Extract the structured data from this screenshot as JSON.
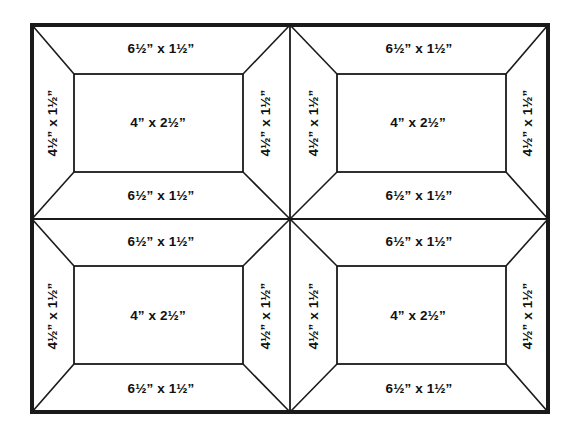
{
  "diagram": {
    "type": "quilt-block-cutting-diagram",
    "background_color": "#ffffff",
    "line_color": "#1a1a1a",
    "text_color": "#111111",
    "outer_border_width_px": 4,
    "inner_line_width_px": 1.6,
    "grid": {
      "rows": 2,
      "cols": 2,
      "blocks": 4
    },
    "labels": {
      "top_strip": "6½” x 1½”",
      "bottom_strip": "6½” x 1½”",
      "left_strip": "4½” x 1½”",
      "right_strip": "4½” x 1½”",
      "center_piece": "4” x 2½”"
    },
    "blocks": [
      {
        "id": "block-top-left",
        "position": "top-left",
        "center": "4” x 2½”",
        "top": "6½” x 1½”",
        "bottom": "6½” x 1½”",
        "left": "4½” x 1½”",
        "right": "4½” x 1½”"
      },
      {
        "id": "block-top-right",
        "position": "top-right",
        "center": "4” x 2½”",
        "top": "6½” x 1½”",
        "bottom": "6½” x 1½”",
        "left": "4½” x 1½”",
        "right": "4½” x 1½”"
      },
      {
        "id": "block-bottom-left",
        "position": "bottom-left",
        "center": "4” x 2½”",
        "top": "6½” x 1½”",
        "bottom": "6½” x 1½”",
        "left": "4½” x 1½”",
        "right": "4½” x 1½”"
      },
      {
        "id": "block-bottom-right",
        "position": "bottom-right",
        "center": "4” x 2½”",
        "top": "6½” x 1½”",
        "bottom": "6½” x 1½”",
        "left": "4½” x 1½”",
        "right": "4½” x 1½”"
      }
    ]
  }
}
